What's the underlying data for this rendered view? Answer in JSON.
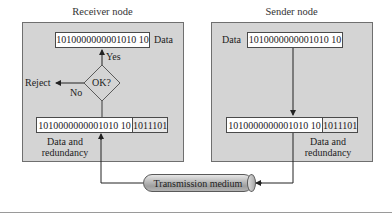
{
  "receiver": {
    "title": "Receiver node",
    "data_box": "1010000000001010 10",
    "data_label": "Data",
    "decision": {
      "label": "OK?",
      "yes_label": "Yes",
      "no_label": "No",
      "reject_label": "Reject"
    },
    "combined": {
      "data": "1010000000001010 10",
      "redundancy": "1011101"
    },
    "combined_label_line1": "Data and",
    "combined_label_line2": "redundancy"
  },
  "sender": {
    "title": "Sender node",
    "data_label": "Data",
    "data_box": "1010000000001010 10",
    "combined": {
      "data": "1010000000001010 10",
      "redundancy": "1011101"
    },
    "combined_label_line1": "Data and",
    "combined_label_line2": "redundancy"
  },
  "medium": {
    "label": "Transmission medium"
  },
  "colors": {
    "panel_fill": "#d4d4d4",
    "panel_border": "#6f6f6f",
    "box_fill": "#ffffff",
    "redundancy_fill": "#e8e8e8",
    "line": "#3a3a3a",
    "diamond_fill": "#d4d4d4"
  }
}
